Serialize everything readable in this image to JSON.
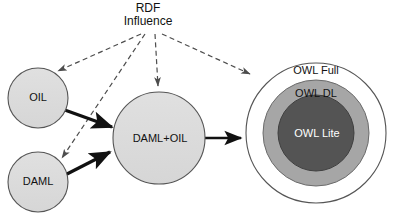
{
  "diagram": {
    "title": "RDF\nInfluence",
    "title_line1": "RDF",
    "title_line2": "Influence",
    "background_color": "#ffffff",
    "stroke_color": "#1a1a1a",
    "dashed_color": "#4d4d4d"
  },
  "nodes": {
    "oil": {
      "label": "OIL",
      "fill": "#dcdcdc",
      "cx": 38,
      "cy": 98,
      "r": 30
    },
    "daml": {
      "label": "DAML",
      "fill": "#dcdcdc",
      "cx": 38,
      "cy": 182,
      "r": 30
    },
    "damloil": {
      "label": "DAML+OIL",
      "fill": "#dcdcdc",
      "cx": 159,
      "cy": 138,
      "r": 46
    },
    "owl_full": {
      "label": "OWL Full",
      "fill": "#ffffff",
      "cx": 316,
      "cy": 133,
      "r": 70
    },
    "owl_dl": {
      "label": "OWL DL",
      "fill": "#a6a6a6",
      "cx": 316,
      "cy": 133,
      "r": 53
    },
    "owl_lite": {
      "label": "OWL Lite",
      "fill": "#545454",
      "cx": 316,
      "cy": 133,
      "r": 38
    }
  },
  "edges": {
    "solid": [
      {
        "name": "oil-to-damloil",
        "from": "OIL",
        "to": "DAML+OIL",
        "style": "solid"
      },
      {
        "name": "daml-to-damloil",
        "from": "DAML",
        "to": "DAML+OIL",
        "style": "solid"
      },
      {
        "name": "damloil-to-owl",
        "from": "DAML+OIL",
        "to": "OWL Full",
        "style": "solid"
      }
    ],
    "dashed": [
      {
        "name": "rdf-to-oil",
        "from": "RDF Influence",
        "to": "OIL",
        "style": "dashed"
      },
      {
        "name": "rdf-to-daml",
        "from": "RDF Influence",
        "to": "DAML",
        "style": "dashed"
      },
      {
        "name": "rdf-to-damloil",
        "from": "RDF Influence",
        "to": "DAML+OIL",
        "style": "dashed"
      },
      {
        "name": "rdf-to-owlfull",
        "from": "RDF Influence",
        "to": "OWL Full",
        "style": "dashed"
      }
    ]
  }
}
